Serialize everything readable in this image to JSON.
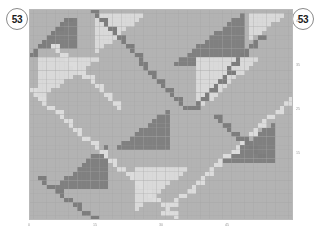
{
  "badges": {
    "left": {
      "name": "badge-left",
      "value": "53"
    },
    "right": {
      "name": "badge-right",
      "value": "53"
    }
  },
  "colors": {
    "background": "#ffffff",
    "cell_base": "#b3b3b3",
    "cell_dark": "#808080",
    "cell_light": "#d9d9d9",
    "cell_diagonal": "#dcdcdc",
    "cell_diagonal_dark": "#7d7d7d",
    "gridline": "#a8a8a8",
    "axis": "#b9b9b9",
    "tick_text": "#9a9a9a",
    "badge_border": "#8a8a8a",
    "badge_text": "#1a1a1a"
  },
  "chart_data": {
    "type": "heatmap",
    "title": "",
    "xlabel": "",
    "ylabel": "",
    "grid": true,
    "legend": "none",
    "cols": 60,
    "rows": 48,
    "cell_px": 4.4,
    "xlim": [
      0,
      60
    ],
    "ylim": [
      0,
      48
    ],
    "xticks": [
      {
        "value": 0,
        "label": "0"
      },
      {
        "value": 15,
        "label": "15"
      },
      {
        "value": 30,
        "label": "30"
      },
      {
        "value": 45,
        "label": "45"
      }
    ],
    "yticks": [
      {
        "value": 45,
        "label": "45"
      },
      {
        "value": 35,
        "label": "35"
      },
      {
        "value": 25,
        "label": "25"
      },
      {
        "value": 15,
        "label": "15"
      }
    ],
    "value_levels": {
      "base": 0.5,
      "dark": 0.15,
      "light": 0.85,
      "diagonal_light": 0.9,
      "diagonal_dark": 0.12
    },
    "motifs": [
      {
        "kind": "triangle-dark",
        "col": 2,
        "row": 2,
        "w": 9,
        "h": 7,
        "orient": "right-tall"
      },
      {
        "kind": "triangle-dark",
        "col": 33,
        "row": 1,
        "w": 16,
        "h": 12,
        "orient": "right-tall"
      },
      {
        "kind": "triangle-dark",
        "col": 20,
        "row": 23,
        "w": 12,
        "h": 9,
        "orient": "right-tall"
      },
      {
        "kind": "triangle-dark",
        "col": 6,
        "row": 31,
        "w": 12,
        "h": 10,
        "orient": "right-tall"
      },
      {
        "kind": "triangle-dark",
        "col": 44,
        "row": 26,
        "w": 12,
        "h": 9,
        "orient": "right-tall"
      },
      {
        "kind": "triangle-light",
        "col": 15,
        "row": 1,
        "w": 11,
        "h": 9,
        "orient": "left-tall"
      },
      {
        "kind": "triangle-light",
        "col": 2,
        "row": 11,
        "w": 14,
        "h": 9,
        "orient": "left-tall"
      },
      {
        "kind": "triangle-light",
        "col": 38,
        "row": 11,
        "w": 14,
        "h": 12,
        "orient": "left-tall"
      },
      {
        "kind": "triangle-light",
        "col": 24,
        "row": 36,
        "w": 12,
        "h": 10,
        "orient": "left-tall"
      },
      {
        "kind": "triangle-light",
        "col": 50,
        "row": 1,
        "w": 8,
        "h": 6,
        "orient": "left-tall"
      },
      {
        "kind": "diagonal-light",
        "from": [
          0,
          18
        ],
        "to": [
          33,
          47
        ],
        "slope": -1
      },
      {
        "kind": "diagonal-light",
        "from": [
          30,
          46
        ],
        "to": [
          59,
          20
        ],
        "slope": 1
      },
      {
        "kind": "diagonal-light",
        "from": [
          5,
          8
        ],
        "to": [
          20,
          22
        ],
        "slope": -1
      },
      {
        "kind": "diagonal-dark",
        "from": [
          14,
          0
        ],
        "to": [
          35,
          22
        ],
        "slope": -1
      },
      {
        "kind": "diagonal-dark",
        "from": [
          37,
          22
        ],
        "to": [
          52,
          6
        ],
        "slope": 1
      },
      {
        "kind": "diagonal-dark",
        "from": [
          0,
          10
        ],
        "to": [
          8,
          2
        ],
        "slope": 1
      },
      {
        "kind": "diagonal-dark",
        "from": [
          2,
          38
        ],
        "to": [
          14,
          47
        ],
        "slope": -1
      },
      {
        "kind": "diagonal-dark",
        "from": [
          42,
          24
        ],
        "to": [
          52,
          33
        ],
        "slope": -1
      }
    ]
  }
}
